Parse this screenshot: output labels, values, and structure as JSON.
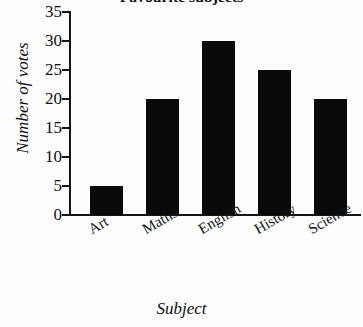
{
  "chart_data": {
    "type": "bar",
    "title": "Favourite subjects",
    "xlabel": "Subject",
    "ylabel": "Number of votes",
    "categories": [
      "Art",
      "Maths",
      "English",
      "History",
      "Science"
    ],
    "values": [
      5,
      20,
      30,
      25,
      20
    ],
    "ylim": [
      0,
      35
    ],
    "ytick_step": 5,
    "yticks": [
      0,
      5,
      10,
      15,
      20,
      25,
      30,
      35
    ],
    "ytick_labels": [
      "0",
      "5",
      "10",
      "15",
      "20",
      "25",
      "30",
      "35"
    ],
    "grid": false,
    "legend": false,
    "bar_color": "#0a0a0a",
    "axis_color": "#151515",
    "background_color": "#ffffff",
    "category_label_rotation_degrees": -30,
    "series": [
      {
        "name": "Number of votes",
        "values": [
          5,
          20,
          30,
          25,
          20
        ]
      }
    ]
  }
}
